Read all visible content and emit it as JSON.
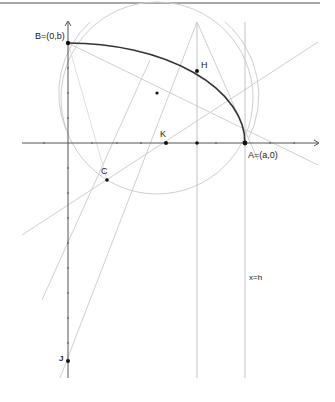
{
  "diagram": {
    "type": "geometry-construction",
    "colors": {
      "axis": "#555555",
      "construction": "#c8c8c8",
      "ellipse_arc": "#333333",
      "point": "#111111",
      "border": "#777777"
    },
    "labels": {
      "B": "B=(0,b)",
      "H": "H",
      "K": "K",
      "A": "A=(a,0)",
      "C": "C",
      "J": "J",
      "line_eq": "x=h"
    },
    "points": [
      {
        "name": "B",
        "x": 68,
        "y": 43
      },
      {
        "name": "H",
        "x": 197,
        "y": 71
      },
      {
        "name": "A",
        "x": 245,
        "y": 143
      },
      {
        "name": "K",
        "x": 166,
        "y": 143
      },
      {
        "name": "C",
        "x": 107,
        "y": 180
      },
      {
        "name": "J",
        "x": 68,
        "y": 361
      },
      {
        "name": "M",
        "x": 157,
        "y": 93
      },
      {
        "name": "Hx",
        "x": 197,
        "y": 143
      }
    ]
  }
}
